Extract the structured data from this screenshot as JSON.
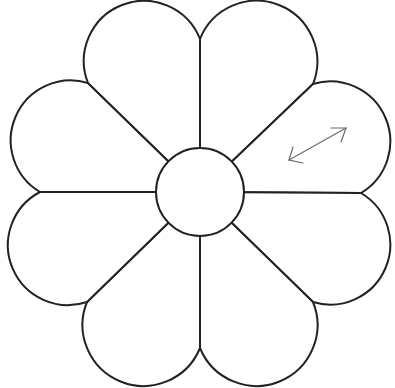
{
  "diagram": {
    "type": "quilt-template",
    "petal_count": 8,
    "center": {
      "x": 200,
      "y": 192,
      "radius": 44
    },
    "outer_points": [
      {
        "name": "top",
        "x": 200,
        "y": 39
      },
      {
        "name": "top-right",
        "x": 313,
        "y": 84
      },
      {
        "name": "right",
        "x": 361,
        "y": 193
      },
      {
        "name": "bottom-right",
        "x": 313,
        "y": 302
      },
      {
        "name": "bottom",
        "x": 200,
        "y": 348
      },
      {
        "name": "bottom-left",
        "x": 87,
        "y": 302
      },
      {
        "name": "left",
        "x": 40,
        "y": 192
      },
      {
        "name": "top-left",
        "x": 88,
        "y": 83
      }
    ],
    "grainline_arrow": {
      "label": "grainline",
      "from": {
        "x": 289,
        "y": 160
      },
      "to": {
        "x": 346,
        "y": 128
      }
    },
    "colors": {
      "stroke": "#222222",
      "arrow": "#6a6a6a",
      "background": "#ffffff"
    }
  }
}
